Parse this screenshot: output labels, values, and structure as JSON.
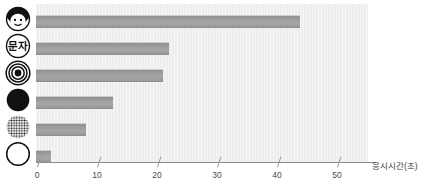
{
  "chart_data": {
    "type": "bar",
    "orientation": "horizontal",
    "title": "",
    "xlabel": "응시시간(초)",
    "ylabel": "",
    "xlim": [
      0,
      56
    ],
    "xticks": [
      0,
      10,
      20,
      30,
      40,
      50
    ],
    "xticklabels": [
      "0",
      "10",
      "20",
      "30",
      "40",
      "50"
    ],
    "grid": false,
    "legend": false,
    "categories": [
      "face-icon",
      "text-circle-icon",
      "bullseye-icon",
      "filled-circle-icon",
      "halftone-dots-circle-icon",
      "outline-circle-icon"
    ],
    "category_labels": [
      "",
      "문자",
      "",
      "",
      "",
      ""
    ],
    "values": [
      44.5,
      22.5,
      21.5,
      13.0,
      8.5,
      2.5
    ],
    "bar_color": "#9e9e9e",
    "plot_background": "#ededed",
    "axis_color": "#8c8c8c"
  },
  "axis": {
    "x_title": "응시시간(초)",
    "ticks": [
      {
        "value": 0,
        "label": "0"
      },
      {
        "value": 10,
        "label": "10"
      },
      {
        "value": 20,
        "label": "20"
      },
      {
        "value": 30,
        "label": "30"
      },
      {
        "value": 40,
        "label": "40"
      },
      {
        "value": 50,
        "label": "50"
      }
    ]
  },
  "icons": {
    "face": "face-icon",
    "text_circle": "text-circle-icon",
    "text_circle_label": "문자",
    "bullseye": "bullseye-icon",
    "filled_circle": "filled-circle-icon",
    "halftone": "halftone-dots-circle-icon",
    "outline_circle": "outline-circle-icon"
  }
}
